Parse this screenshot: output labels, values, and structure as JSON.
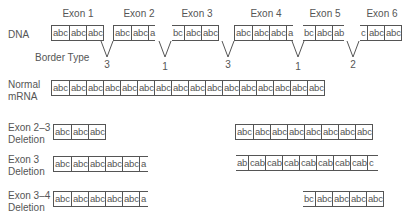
{
  "dna": {
    "label": "DNA",
    "exons": [
      {
        "title": "Exon 1",
        "cells": [
          "abc",
          "abc",
          "abc"
        ]
      },
      {
        "title": "Exon 2",
        "cells": [
          "abc",
          "abc",
          "a"
        ]
      },
      {
        "title": "Exon 3",
        "cells": [
          "bc",
          "abc",
          "abc"
        ]
      },
      {
        "title": "Exon 4",
        "cells": [
          "abc",
          "abc",
          "abc",
          "a"
        ]
      },
      {
        "title": "Exon 5",
        "cells": [
          "bc",
          "abc",
          "ab"
        ]
      },
      {
        "title": "Exon 6",
        "cells": [
          "c",
          "abc",
          "abc"
        ]
      }
    ]
  },
  "border_type": {
    "label": "Border Type",
    "values": [
      "3",
      "1",
      "3",
      "1",
      "2"
    ]
  },
  "normal_mrna": {
    "label_line1": "Normal",
    "label_line2": "mRNA",
    "cells": [
      "abc",
      "abc",
      "abc",
      "abc",
      "abc",
      "abc",
      "abc",
      "abc",
      "abc",
      "abc",
      "abc",
      "abc",
      "abc",
      "abc",
      "abc",
      "abc"
    ]
  },
  "deletions": [
    {
      "label_line1": "Exon 2–3",
      "label_line2": "Deletion",
      "left_cells": [
        "abc",
        "abc",
        "abc"
      ],
      "right_cells": [
        "abc",
        "abc",
        "abc",
        "abc",
        "abc",
        "abc",
        "abc",
        "abc"
      ]
    },
    {
      "label_line1": "Exon 3",
      "label_line2": "Deletion",
      "left_cells": [
        "abc",
        "abc",
        "abc",
        "abc",
        "abc",
        "a"
      ],
      "right_cells": [
        "ab",
        "cab",
        "cab",
        "cab",
        "cab",
        "cab",
        "cab",
        "cab",
        "c"
      ]
    },
    {
      "label_line1": "Exon 3–4",
      "label_line2": "Deletion",
      "left_cells": [
        "abc",
        "abc",
        "abc",
        "abc",
        "abc",
        "a"
      ],
      "right_cells": [
        "bc",
        "abc",
        "abc",
        "abc",
        "abc"
      ]
    }
  ]
}
